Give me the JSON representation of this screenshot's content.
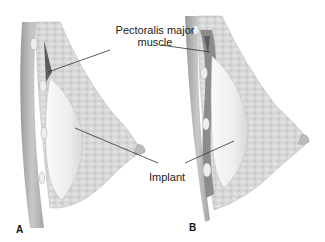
{
  "figure": {
    "panels": [
      {
        "letter": "A"
      },
      {
        "letter": "B"
      }
    ],
    "labels": {
      "pectoralis_line1": "Pectoralis major",
      "pectoralis_line2": "muscle",
      "implant": "Implant"
    },
    "colors": {
      "background": "#ffffff",
      "tissue": "#d9d9d9",
      "tissue_dark": "#bdbdbd",
      "muscle": "#a8a8a8",
      "muscle_dark": "#6e6e6e",
      "implant": "#f2f2f2",
      "leader_line": "#333333",
      "text": "#222222"
    }
  }
}
